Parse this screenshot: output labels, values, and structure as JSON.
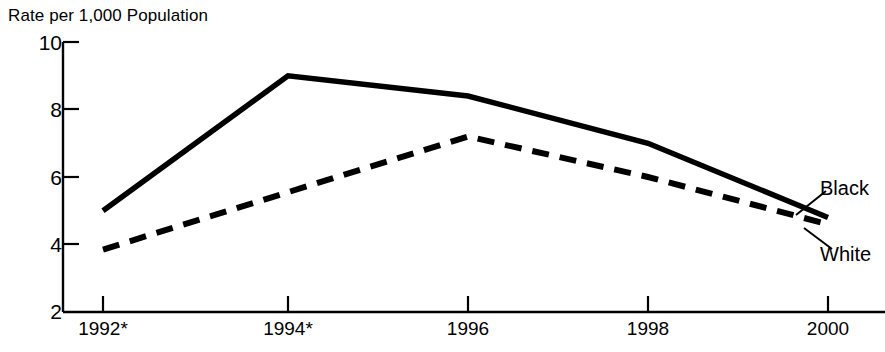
{
  "chart_data": {
    "type": "line",
    "title": "Rate per 1,000 Population",
    "xlabel": "",
    "ylabel": "Rate per 1,000 Population",
    "x": [
      "1992*",
      "1994*",
      "1996",
      "1998",
      "2000"
    ],
    "xlim": [
      1991.6,
      2000.6
    ],
    "ylim": [
      2,
      10
    ],
    "yticks": [
      10,
      8,
      6,
      4,
      2
    ],
    "ytick_labels": [
      "10",
      "8",
      "6",
      "4",
      "2"
    ],
    "xtick_labels": [
      "1992*",
      "1994*",
      "1996",
      "1998",
      "2000"
    ],
    "grid": false,
    "legend_position": "inline-right-annotation",
    "series": [
      {
        "name": "Black",
        "style": "solid",
        "color": "#000000",
        "values": [
          5.0,
          9.0,
          8.4,
          7.0,
          4.8
        ]
      },
      {
        "name": "White",
        "style": "dashed",
        "color": "#000000",
        "values": [
          3.85,
          5.55,
          7.2,
          6.0,
          4.6
        ]
      }
    ],
    "annotations": [
      {
        "name": "Black",
        "text": "Black"
      },
      {
        "name": "White",
        "text": "White"
      }
    ]
  }
}
